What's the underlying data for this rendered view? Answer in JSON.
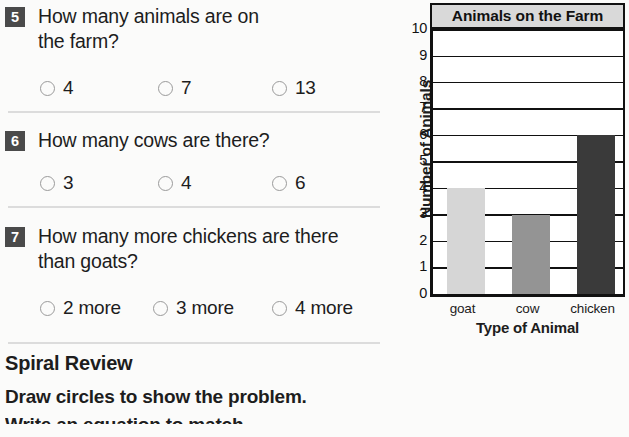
{
  "questions": [
    {
      "number": "5",
      "text_lines": [
        "How many animals are on",
        "the farm?"
      ],
      "options": [
        {
          "label": "4"
        },
        {
          "label": "7"
        },
        {
          "label": "13"
        }
      ]
    },
    {
      "number": "6",
      "text_lines": [
        "How many cows are there?"
      ],
      "options": [
        {
          "label": "3"
        },
        {
          "label": "4"
        },
        {
          "label": "6"
        }
      ]
    },
    {
      "number": "7",
      "text_lines": [
        "How many more chickens are there",
        "than goats?"
      ],
      "options": [
        {
          "label": "2 more"
        },
        {
          "label": "3 more"
        },
        {
          "label": "4 more"
        }
      ]
    }
  ],
  "spiral_review": {
    "title": "Spiral Review",
    "instruction": "Draw circles to show the problem.",
    "instruction_2": "Write an equation to match."
  },
  "chart_data": {
    "type": "bar",
    "title": "Animals on the Farm",
    "xlabel": "Type of Animal",
    "ylabel": "Number of Animals",
    "categories": [
      "goat",
      "cow",
      "chicken"
    ],
    "values": [
      4,
      3,
      6
    ],
    "ylim": [
      0,
      10
    ],
    "yticks": [
      "10",
      "9",
      "8",
      "7",
      "6",
      "5",
      "4",
      "3",
      "2",
      "1",
      "0"
    ],
    "grid": true,
    "legend": "none",
    "bar_colors": [
      "#d6d6d6",
      "#949494",
      "#3a3a3a"
    ]
  },
  "colors": {
    "badge_bg": "#4a4a4a",
    "badge_text": "#ffffff",
    "separator": "#dcdcdc",
    "chart_frame": "#111111",
    "title_band": "#d9d9d9",
    "page_bg": "#fbfbfa"
  }
}
